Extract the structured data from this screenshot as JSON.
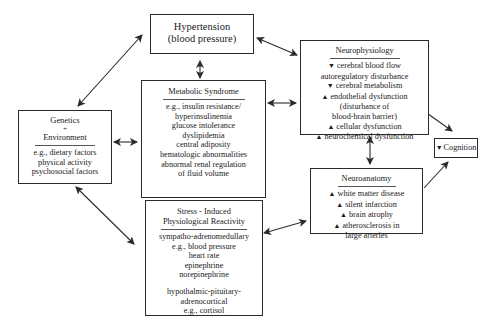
{
  "boxes": {
    "hypertension": {
      "title_lines": [
        "Hypertension",
        "(blood pressure)"
      ]
    },
    "genetics": {
      "title_lines": [
        "Genetics",
        "+",
        "Environment"
      ],
      "items": [
        "e.g., dietary factors",
        "physical activity",
        "psychosocial factors"
      ]
    },
    "metabolic": {
      "title": "Metabolic Syndrome",
      "items": [
        "e.g., insulin resistance/",
        "hyperinsulinemia",
        "glucose intolerance",
        "dyslipidemia",
        "central adiposity",
        "hematologic abnormalities",
        "abnormal renal regulation",
        "of fluid volume"
      ]
    },
    "stress": {
      "title_lines": [
        "Stress - Induced",
        "Physiological Reactivity"
      ],
      "items": [
        "sympatho-adrenomedullary",
        "e.g., blood pressure",
        "heart rate",
        "epinephrine",
        "norepinephrine"
      ],
      "items2": [
        "hypothalmic-pituitary-",
        "adrenocortical",
        "e.g., cortisol"
      ]
    },
    "neurophysiology": {
      "title": "Neurophysiology",
      "items": [
        {
          "arrow": "▼",
          "text": "cerebral blood flow"
        },
        {
          "arrow": "",
          "text": "autoregulatory disturbance"
        },
        {
          "arrow": "▼",
          "text": "cerebral metabolism"
        },
        {
          "arrow": "▲",
          "text": "endothelial dysfunction"
        },
        {
          "arrow": "",
          "text": "(disturbance of"
        },
        {
          "arrow": "",
          "text": "blood-brain barrier)"
        },
        {
          "arrow": "▲",
          "text": "cellular dysfunction"
        },
        {
          "arrow": "▲",
          "text": "neurochemical dysfunction"
        }
      ]
    },
    "neuroanatomy": {
      "title": "Neuroanatomy",
      "items": [
        {
          "arrow": "▲",
          "text": "white matter disease"
        },
        {
          "arrow": "▲",
          "text": "silent infarction"
        },
        {
          "arrow": "▲",
          "text": "brain atrophy"
        },
        {
          "arrow": "▲",
          "text": "atherosclerosis in"
        },
        {
          "arrow": "",
          "text": "large arteries"
        }
      ]
    },
    "cognition": {
      "arrow": "▼",
      "text": "Cognition"
    }
  },
  "colors": {
    "line": "#2a2a2a",
    "background": "#ffffff"
  }
}
